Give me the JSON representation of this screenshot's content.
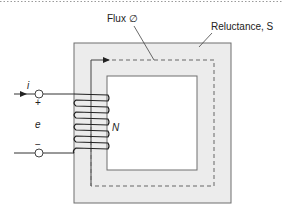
{
  "figure": {
    "type": "magnetic circuit diagram",
    "labels": {
      "flux": "Flux ∅",
      "reluctance": "Reluctance, S",
      "current": "i",
      "plus": "+",
      "minus": "−",
      "emf": "e",
      "turns": "N"
    },
    "colors": {
      "core_fill": "#ececec",
      "core_stroke": "#6e6e6e",
      "window_fill": "#ffffff",
      "wire": "#333333",
      "flux_path": "#666666",
      "top_border": "#9a9a9a"
    },
    "coil_turns": 8
  }
}
